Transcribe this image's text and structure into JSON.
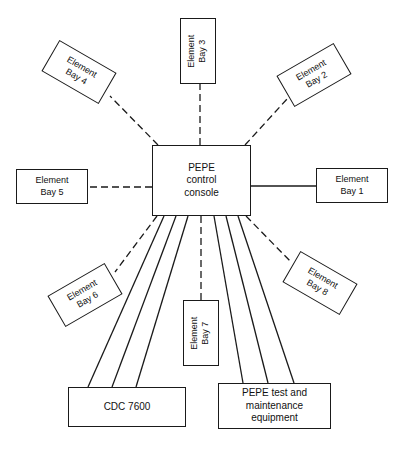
{
  "diagram": {
    "type": "block-diagram",
    "title_present": false,
    "central_node": {
      "id": "pepe-control-console",
      "label": "PEPE\ncontrol\nconsole",
      "lines": [
        "PEPE",
        "control",
        "console"
      ],
      "x": 152,
      "y": 145,
      "w": 99,
      "h": 71,
      "rotation": 0
    },
    "element_bays": [
      {
        "id": "element-bay-1",
        "label": "Element\nBay 1",
        "lines": [
          "Element",
          "Bay 1"
        ],
        "x": 316,
        "y": 168,
        "w": 72,
        "h": 35,
        "rotation": 0,
        "connector": "solid",
        "side": "right"
      },
      {
        "id": "element-bay-2",
        "label": "Element\nBay 2",
        "lines": [
          "Element",
          "Bay 2"
        ],
        "x": 281,
        "y": 57,
        "w": 66,
        "h": 36,
        "rotation": -30,
        "connector": "dashed",
        "side": "upper-right"
      },
      {
        "id": "element-bay-3",
        "label": "Element\nBay 3",
        "lines": [
          "Element",
          "Bay 3"
        ],
        "x": 180,
        "y": 18,
        "w": 36,
        "h": 66,
        "rotation": -90,
        "connector": "dashed",
        "side": "top"
      },
      {
        "id": "element-bay-4",
        "label": "Element\nBay 4",
        "lines": [
          "Element",
          "Bay 4"
        ],
        "x": 46,
        "y": 54,
        "w": 66,
        "h": 36,
        "rotation": 30,
        "connector": "dashed",
        "side": "upper-left"
      },
      {
        "id": "element-bay-5",
        "label": "Element\nBay 5",
        "lines": [
          "Element",
          "Bay 5"
        ],
        "x": 16,
        "y": 169,
        "w": 72,
        "h": 35,
        "rotation": 0,
        "connector": "dashed",
        "side": "left"
      },
      {
        "id": "element-bay-6",
        "label": "Element\nBay 6",
        "lines": [
          "Element",
          "Bay 6"
        ],
        "x": 52,
        "y": 277,
        "w": 66,
        "h": 36,
        "rotation": -30,
        "connector": "dashed",
        "side": "lower-left"
      },
      {
        "id": "element-bay-7",
        "label": "Element\nBay 7",
        "lines": [
          "Element",
          "Bay 7"
        ],
        "x": 183,
        "y": 300,
        "w": 36,
        "h": 66,
        "rotation": -90,
        "connector": "dashed",
        "side": "bottom"
      },
      {
        "id": "element-bay-8",
        "label": "Element\nBay 8",
        "lines": [
          "Element",
          "Bay 8"
        ],
        "x": 287,
        "y": 265,
        "w": 66,
        "h": 36,
        "rotation": 30,
        "connector": "dashed",
        "side": "lower-right"
      }
    ],
    "peripheral_nodes": [
      {
        "id": "cdc-7600",
        "label": "CDC 7600",
        "lines": [
          "CDC 7600"
        ],
        "x": 68,
        "y": 387,
        "w": 118,
        "h": 40,
        "rotation": 0,
        "connector": "solid",
        "trunk_lines": 3
      },
      {
        "id": "pepe-test-maintenance-equipment",
        "label": "PEPE test and\nmaintenance\nequipment",
        "lines": [
          "PEPE test and",
          "maintenance",
          "equipment"
        ],
        "x": 218,
        "y": 383,
        "w": 113,
        "h": 46,
        "rotation": 0,
        "connector": "solid",
        "trunk_lines": 3
      }
    ],
    "legend": {
      "dashed_meaning": "Element Bay link",
      "solid_meaning": "Trunk / data link"
    },
    "colors": {
      "background": "#ffffff",
      "stroke": "#1a1a1a",
      "text": "#111111"
    }
  }
}
